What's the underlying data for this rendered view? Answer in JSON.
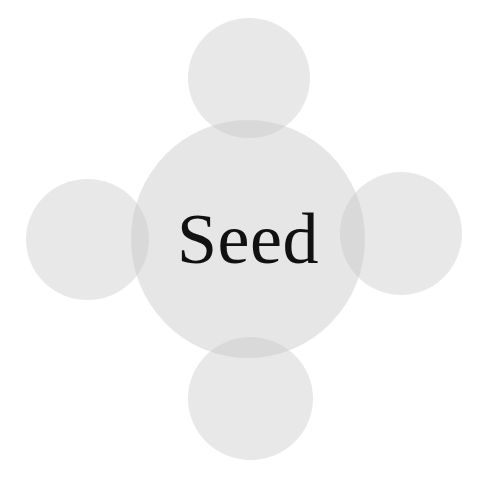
{
  "diagram": {
    "type": "cluster",
    "center": {
      "label": "Seed"
    },
    "satellites": [
      {
        "position": "top",
        "label": ""
      },
      {
        "position": "left",
        "label": ""
      },
      {
        "position": "right",
        "label": ""
      },
      {
        "position": "bottom",
        "label": ""
      }
    ],
    "colors": {
      "background": "#ffffff",
      "circle_fill": "#dcdcdc",
      "overlap_fill": "#cfcfcf",
      "text": "#111111"
    }
  }
}
